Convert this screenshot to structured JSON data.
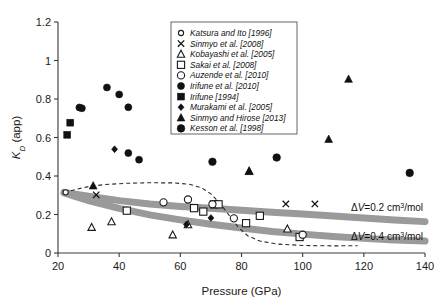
{
  "chart_data": {
    "type": "scatter",
    "title": "",
    "xlabel": "Pressure (GPa)",
    "ylabel": "K_D (app)",
    "ylabel_parts": {
      "symbol": "K",
      "subscript": "D",
      "rest": " (app)"
    },
    "xlim": [
      20,
      140
    ],
    "ylim": [
      0,
      1.2
    ],
    "xticks": [
      20,
      40,
      60,
      80,
      100,
      120,
      140
    ],
    "yticks": [
      0,
      0.2,
      0.4,
      0.6,
      0.8,
      1,
      1.2
    ],
    "xticklabels": [
      "20",
      "40",
      "60",
      "80",
      "100",
      "120",
      "140"
    ],
    "yticklabels": [
      "0",
      "0.2",
      "0.4",
      "0.6",
      "0.8",
      "1",
      "1.2"
    ],
    "grid": false,
    "legend_position": "top-center",
    "series": [
      {
        "name": "Katsura and Ito [1996]",
        "marker": "circle-open-small",
        "points": [
          [
            22.5,
            0.315
          ]
        ]
      },
      {
        "name": "Sinmyo et al. [2008]",
        "marker": "x",
        "points": [
          [
            32.5,
            0.302
          ],
          [
            94.5,
            0.255
          ],
          [
            104.0,
            0.255
          ]
        ]
      },
      {
        "name": "Kobayashi et al. [2005]",
        "marker": "triangle-open",
        "points": [
          [
            31.0,
            0.133
          ],
          [
            37.5,
            0.162
          ],
          [
            57.5,
            0.094
          ],
          [
            62.5,
            0.147
          ],
          [
            82.5,
            0.425
          ],
          [
            95.0,
            0.125
          ]
        ]
      },
      {
        "name": "Sakai et al. [2008]",
        "marker": "square-open",
        "points": [
          [
            42.5,
            0.22
          ],
          [
            64.5,
            0.233
          ],
          [
            67.5,
            0.215
          ],
          [
            71.0,
            0.253
          ],
          [
            72.5,
            0.253
          ],
          [
            81.5,
            0.155
          ],
          [
            86.0,
            0.193
          ],
          [
            99.0,
            0.083
          ]
        ]
      },
      {
        "name": "Auzende et al. [2010]",
        "marker": "circle-open",
        "points": [
          [
            54.5,
            0.263
          ],
          [
            62.5,
            0.278
          ],
          [
            70.5,
            0.253
          ],
          [
            77.5,
            0.18
          ],
          [
            100.0,
            0.095
          ]
        ]
      },
      {
        "name": "Irifune et al. [2010]",
        "marker": "circle-filled",
        "points": [
          [
            27.0,
            0.756
          ],
          [
            27.8,
            0.752
          ],
          [
            36.0,
            0.86
          ],
          [
            40.0,
            0.824
          ],
          [
            43.0,
            0.757
          ],
          [
            43.0,
            0.519
          ],
          [
            46.5,
            0.485
          ]
        ]
      },
      {
        "name": "Irifune [1994]",
        "marker": "square-filled",
        "points": [
          [
            23.0,
            0.614
          ],
          [
            24.0,
            0.677
          ]
        ]
      },
      {
        "name": "Murakami et al. [2005]",
        "marker": "diamond-filled",
        "points": [
          [
            38.5,
            0.539
          ],
          [
            62.0,
            0.148
          ],
          [
            70.0,
            0.182
          ]
        ]
      },
      {
        "name": "Sinmyo and Hirose [2013]",
        "marker": "triangle-filled",
        "points": [
          [
            31.5,
            0.349
          ],
          [
            82.5,
            0.424
          ],
          [
            108.5,
            0.591
          ],
          [
            115.0,
            0.903
          ]
        ]
      },
      {
        "name": "Kesson et al. [1998]",
        "marker": "circle-filled-large",
        "points": [
          [
            70.5,
            0.474
          ],
          [
            91.5,
            0.496
          ],
          [
            135.0,
            0.416
          ]
        ]
      }
    ],
    "curves": [
      {
        "name": "dV=0.2",
        "style": "gray-band",
        "label": "ΔV=0.2 cm3/mol",
        "label_parts": {
          "delta": "Δ",
          "v": "V",
          "eq": "=0.2 cm",
          "sup": "3",
          "unit": "/mol"
        },
        "points": [
          [
            22.0,
            0.315
          ],
          [
            30.0,
            0.295
          ],
          [
            40.0,
            0.272
          ],
          [
            50.0,
            0.255
          ],
          [
            60.0,
            0.242
          ],
          [
            70.0,
            0.232
          ],
          [
            80.0,
            0.222
          ],
          [
            90.0,
            0.212
          ],
          [
            100.0,
            0.203
          ],
          [
            110.0,
            0.192
          ],
          [
            120.0,
            0.182
          ],
          [
            130.0,
            0.172
          ],
          [
            140.0,
            0.163
          ]
        ]
      },
      {
        "name": "dV=0.4",
        "style": "gray-band",
        "label": "ΔV=0.4 cm3/mol",
        "label_parts": {
          "delta": "Δ",
          "v": "V",
          "eq": "=0.4 cm",
          "sup": "3",
          "unit": "/mol"
        },
        "points": [
          [
            22.0,
            0.312
          ],
          [
            30.0,
            0.272
          ],
          [
            40.0,
            0.232
          ],
          [
            50.0,
            0.198
          ],
          [
            60.0,
            0.172
          ],
          [
            70.0,
            0.149
          ],
          [
            80.0,
            0.13
          ],
          [
            90.0,
            0.112
          ],
          [
            100.0,
            0.098
          ],
          [
            110.0,
            0.086
          ],
          [
            120.0,
            0.076
          ],
          [
            130.0,
            0.068
          ],
          [
            140.0,
            0.062
          ]
        ]
      },
      {
        "name": "spin-transition-model",
        "style": "dashed",
        "points": [
          [
            22.0,
            0.313
          ],
          [
            26.0,
            0.331
          ],
          [
            30.0,
            0.345
          ],
          [
            35.0,
            0.355
          ],
          [
            42.0,
            0.362
          ],
          [
            50.0,
            0.365
          ],
          [
            58.0,
            0.364
          ],
          [
            63.0,
            0.357
          ],
          [
            67.0,
            0.338
          ],
          [
            70.0,
            0.307
          ],
          [
            73.0,
            0.257
          ],
          [
            76.0,
            0.195
          ],
          [
            79.0,
            0.133
          ],
          [
            82.0,
            0.09
          ],
          [
            86.0,
            0.062
          ],
          [
            92.0,
            0.046
          ],
          [
            100.0,
            0.039
          ],
          [
            110.0,
            0.037
          ],
          [
            118.0,
            0.038
          ]
        ]
      }
    ]
  },
  "legend": {
    "entries": [
      {
        "label": "Katsura and Ito [1996]",
        "marker": "circle-open-small"
      },
      {
        "label": "Sinmyo et al. [2008]",
        "marker": "x"
      },
      {
        "label": "Kobayashi et al. [2005]",
        "marker": "triangle-open"
      },
      {
        "label": "Sakai et al. [2008]",
        "marker": "square-open"
      },
      {
        "label": "Auzende et al. [2010]",
        "marker": "circle-open"
      },
      {
        "label": "Irifune et al. [2010]",
        "marker": "circle-filled"
      },
      {
        "label": "Irifune [1994]",
        "marker": "square-filled"
      },
      {
        "label": "Murakami et al. [2005]",
        "marker": "diamond-filled"
      },
      {
        "label": "Sinmyo and Hirose [2013]",
        "marker": "triangle-filled"
      },
      {
        "label": "Kesson et al. [1998]",
        "marker": "circle-filled-large"
      }
    ]
  },
  "colors": {
    "background": "#ffffff",
    "axis": "#3a3a3a",
    "marker": "#111111",
    "band": "#9a9a9a",
    "dashed": "#2b2b2b"
  }
}
